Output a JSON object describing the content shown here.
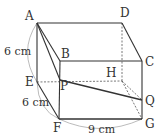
{
  "diagram": {
    "type": "cuboid",
    "vertices": {
      "A": {
        "label": "A",
        "x": 37,
        "y": 23
      },
      "D": {
        "label": "D",
        "x": 122,
        "y": 23
      },
      "B": {
        "label": "B",
        "x": 60,
        "y": 61
      },
      "C": {
        "label": "C",
        "x": 142,
        "y": 61
      },
      "E": {
        "label": "E",
        "x": 37,
        "y": 82
      },
      "H": {
        "label": "H",
        "x": 122,
        "y": 81
      },
      "P": {
        "label": "P",
        "x": 60,
        "y": 80
      },
      "F": {
        "label": "F",
        "x": 59,
        "y": 119
      },
      "G": {
        "label": "G",
        "x": 142,
        "y": 119
      },
      "Q": {
        "label": "Q",
        "x": 142,
        "y": 100
      }
    },
    "dimensions": {
      "AE": "6 cm",
      "EF": "6 cm",
      "FG": "9 cm"
    },
    "colors": {
      "line": "#333333",
      "dashed": "#555555",
      "arc": "#999999"
    }
  }
}
